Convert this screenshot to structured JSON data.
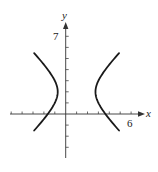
{
  "chart_data": {
    "type": "line",
    "title": "",
    "xlabel": "x",
    "ylabel": "y",
    "xlim": [
      -5,
      6.8
    ],
    "ylim": [
      -4,
      7.8
    ],
    "grid": false,
    "legend": null,
    "x_tick_step": 1,
    "y_tick_step": 1,
    "labeled_ticks": {
      "x": [
        "6"
      ],
      "y": [
        "7"
      ]
    },
    "annotations": [],
    "curve": {
      "kind": "hyperbola",
      "equation": "(x-1)^2/3 - (y-2)^2/3 = 1",
      "center": [
        1,
        2
      ],
      "a": 1.732,
      "b": 1.732,
      "orientation": "horizontal",
      "t_range": [
        -1.45,
        1.45
      ]
    },
    "series": [
      {
        "name": "left branch",
        "x": [
          -4.0,
          -2.5,
          -1.5,
          -0.73,
          -1.5,
          -2.5,
          -4.0
        ],
        "y": [
          6.67,
          4.96,
          3.8,
          2.0,
          0.2,
          -0.96,
          -2.67
        ]
      },
      {
        "name": "right branch",
        "x": [
          6.0,
          4.5,
          3.5,
          2.73,
          3.5,
          4.5,
          6.0
        ],
        "y": [
          6.67,
          4.96,
          3.8,
          2.0,
          0.2,
          -0.96,
          -2.67
        ]
      }
    ]
  },
  "labels": {
    "x_axis": "x",
    "y_axis": "y",
    "x_tick_label": "6",
    "y_tick_label": "7"
  },
  "colors": {
    "curve": "#1a1a1a",
    "axis": "#333333",
    "background": "#ffffff"
  }
}
